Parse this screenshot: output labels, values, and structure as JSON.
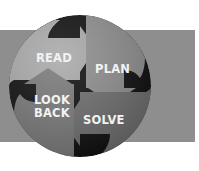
{
  "diagram": {
    "steps": [
      {
        "id": "read",
        "label": "READ",
        "color": "#a9a9a9"
      },
      {
        "id": "plan",
        "label": "PLAN",
        "color": "#8f8f8f"
      },
      {
        "id": "solve",
        "label": "SOLVE",
        "color": "#6f6f6f"
      },
      {
        "id": "look-back",
        "label_line1": "LOOK",
        "label_line2": "BACK",
        "color": "#7a7a7a"
      }
    ],
    "band_color": "#8e8e8e",
    "swirl_color": "#111111",
    "text_color": "#f2f2f2"
  }
}
